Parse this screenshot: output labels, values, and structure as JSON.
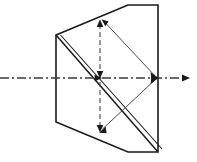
{
  "figure": {
    "kind": "optical-ray-diagram",
    "canvas": {
      "width": 197,
      "height": 162
    },
    "background_color": "#ffffff",
    "line_color": "#1a1a1a",
    "axis_color": "#3a3a3a"
  },
  "prism": {
    "name": "beam-splitter-prism",
    "outline_points": "56,35 128,5 158,5 158,152 128,152 56,122",
    "left_edge": {
      "x": 56,
      "y_top": 35,
      "y_bottom": 122
    },
    "right_edge": {
      "x": 158,
      "y_top": 5,
      "y_bottom": 152
    },
    "top_edge": "56,35 to 128,5 to 158,5",
    "bottom_edge": "56,122 to 128,152 to 158,152"
  },
  "splitter_surface": {
    "name": "cemented-diagonal-surface",
    "description": "double line from upper-left vertex to lower-right vertex",
    "line_a": {
      "x1": 56,
      "y1": 35,
      "x2": 158,
      "y2": 152
    },
    "line_b": {
      "x1": 60,
      "y1": 35,
      "x2": 162,
      "y2": 152
    },
    "offset_px": 3.5
  },
  "optical_axis": {
    "name": "optical-axis",
    "style": "dash-dot",
    "y": 78,
    "x_start": 0,
    "x_end": 188,
    "exit_arrow_at_x": 188,
    "label": ""
  },
  "dashed_vertical": {
    "name": "vertical-image-ray",
    "style": "dashed",
    "x": 100,
    "y_top": 20,
    "y_bottom": 132,
    "arrow_up_at_y": 20,
    "arrow_down_center_at_y": 78,
    "arrow_down_bottom_at_y": 132
  },
  "rays": [
    {
      "name": "upper-ray",
      "from": {
        "x": 158,
        "y": 78
      },
      "to": {
        "x": 103,
        "y": 20
      },
      "arrow_at": "to"
    },
    {
      "name": "lower-ray",
      "from": {
        "x": 158,
        "y": 78
      },
      "to": {
        "x": 100,
        "y": 132
      },
      "arrow_at": "to"
    },
    {
      "name": "upper-return-ray",
      "from": {
        "x": 103,
        "y": 20
      },
      "to": {
        "x": 158,
        "y": 78
      },
      "arrow_at": "to"
    },
    {
      "name": "lower-return-ray",
      "from": {
        "x": 100,
        "y": 132
      },
      "to": {
        "x": 158,
        "y": 78
      },
      "arrow_at": "to"
    }
  ],
  "focal_point": {
    "name": "right-convergence-point",
    "x": 158,
    "y": 78
  },
  "center_point": {
    "name": "axis-splitter-intersection",
    "x": 100,
    "y": 78
  }
}
